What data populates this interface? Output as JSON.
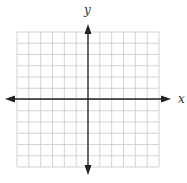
{
  "figure": {
    "type": "coordinate-plane",
    "x_axis_label": "x",
    "y_axis_label": "y",
    "grid": {
      "columns": 12,
      "rows": 12,
      "units_each_direction": 6
    },
    "arrows": [
      "left",
      "right",
      "up",
      "down"
    ]
  },
  "colors": {
    "grid_line": "#c8c8c8",
    "axis": "#222222",
    "label": "#333333",
    "background": "#ffffff"
  }
}
